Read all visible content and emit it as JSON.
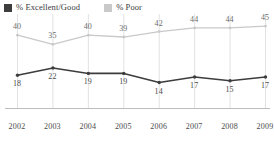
{
  "legend": {
    "entries": [
      {
        "label": "% Excellent/Good",
        "color": "#3d3d3d",
        "swatch_name": "legend-swatch-excellent-good"
      },
      {
        "label": "% Poor",
        "color": "#c9c9c9",
        "swatch_name": "legend-swatch-poor"
      }
    ]
  },
  "chart_data": {
    "type": "line",
    "title": "",
    "subtitle": "",
    "xlabel": "",
    "ylabel": "",
    "categories": [
      "2002",
      "2003",
      "2004",
      "2005",
      "2006",
      "2007",
      "2008",
      "2009"
    ],
    "series": [
      {
        "name": "% Poor",
        "color": "#c9c9c9",
        "label_color": "#6b6b6b",
        "label_position": "above",
        "values": [
          40,
          35,
          40,
          39,
          42,
          44,
          44,
          45
        ]
      },
      {
        "name": "% Excellent/Good",
        "color": "#3d3d3d",
        "label_color": "#4a4a4a",
        "label_position": "below",
        "values": [
          18,
          22,
          19,
          19,
          14,
          17,
          15,
          17
        ]
      }
    ],
    "ylim": [
      0,
      50
    ],
    "grid": {
      "vertical": true,
      "horizontal": false,
      "color": "#e2e2e2"
    },
    "axis": {
      "baseline": true,
      "baseline_color": "#bdbdbd"
    },
    "legend_position": "top-left",
    "marker": "dot"
  }
}
